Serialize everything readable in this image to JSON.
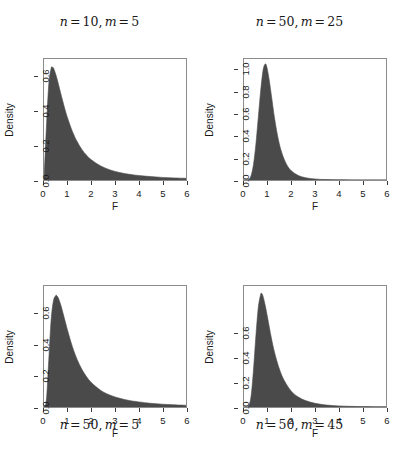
{
  "figure": {
    "background_color": "#ffffff",
    "fill_color": "#4a4a4a",
    "axis_color": "#3a3a3a",
    "box_color": "#8c8c8c"
  },
  "chart_data": [
    {
      "type": "area",
      "title": "n = 10, m = 5",
      "title_position": "top",
      "title_parts": {
        "var1": "n",
        "eq1": "=",
        "val1": "10",
        "comma": ",",
        "var2": "m",
        "eq2": "=",
        "val2": "5"
      },
      "distribution": "F",
      "df1": 10,
      "df2": 5,
      "xlabel": "F",
      "ylabel": "Density",
      "xlim": [
        0,
        6
      ],
      "ylim": [
        0,
        0.7
      ],
      "xticks": [
        "0",
        "1",
        "2",
        "3",
        "4",
        "5",
        "6"
      ],
      "xtick_values": [
        0,
        1,
        2,
        3,
        4,
        5,
        6
      ],
      "yticks": [
        "0.0",
        "0.2",
        "0.4",
        "0.6"
      ],
      "ytick_values": [
        0.0,
        0.2,
        0.4,
        0.6
      ],
      "grid": false,
      "peak_x": 0.35,
      "peak_y": 0.65,
      "x": [
        0.0,
        0.1,
        0.2,
        0.3,
        0.35,
        0.4,
        0.5,
        0.6,
        0.7,
        0.8,
        0.9,
        1.0,
        1.2,
        1.4,
        1.6,
        1.8,
        2.0,
        2.4,
        2.8,
        3.2,
        3.6,
        4.0,
        4.5,
        5.0,
        5.5,
        6.0
      ],
      "y": [
        0.0,
        0.3,
        0.55,
        0.645,
        0.652,
        0.648,
        0.61,
        0.56,
        0.505,
        0.452,
        0.402,
        0.357,
        0.281,
        0.222,
        0.177,
        0.143,
        0.117,
        0.081,
        0.058,
        0.043,
        0.033,
        0.026,
        0.02,
        0.015,
        0.012,
        0.01
      ]
    },
    {
      "type": "area",
      "title": "n = 50, m = 25",
      "title_position": "top",
      "title_parts": {
        "var1": "n",
        "eq1": "=",
        "val1": "50",
        "comma": ",",
        "var2": "m",
        "eq2": "=",
        "val2": "25"
      },
      "distribution": "F",
      "df1": 50,
      "df2": 25,
      "xlabel": "F",
      "ylabel": "Density",
      "xlim": [
        0,
        6
      ],
      "ylim": [
        0,
        1.1
      ],
      "xticks": [
        "0",
        "1",
        "2",
        "3",
        "4",
        "5",
        "6"
      ],
      "xtick_values": [
        0,
        1,
        2,
        3,
        4,
        5,
        6
      ],
      "yticks": [
        "0.0",
        "0.2",
        "0.4",
        "0.6",
        "0.8",
        "1.0"
      ],
      "ytick_values": [
        0.0,
        0.2,
        0.4,
        0.6,
        0.8,
        1.0
      ],
      "grid": false,
      "peak_x": 0.88,
      "peak_y": 1.05,
      "x": [
        0.0,
        0.2,
        0.3,
        0.4,
        0.5,
        0.6,
        0.7,
        0.8,
        0.88,
        0.95,
        1.05,
        1.15,
        1.3,
        1.45,
        1.6,
        1.8,
        2.0,
        2.3,
        2.6,
        3.0,
        3.5,
        4.0,
        4.5,
        5.0,
        5.5,
        6.0
      ],
      "y": [
        0.0,
        0.005,
        0.04,
        0.14,
        0.32,
        0.56,
        0.8,
        0.99,
        1.05,
        1.04,
        0.93,
        0.78,
        0.55,
        0.37,
        0.245,
        0.142,
        0.084,
        0.04,
        0.021,
        0.009,
        0.0035,
        0.0016,
        0.0008,
        0.0004,
        0.0002,
        0.0001
      ]
    },
    {
      "type": "area",
      "title": "n = 50, m = 5",
      "title_position": "bottom",
      "title_parts": {
        "var1": "n",
        "eq1": "=",
        "val1": "50",
        "comma": ",",
        "var2": "m",
        "eq2": "=",
        "val2": "5"
      },
      "distribution": "F",
      "df1": 50,
      "df2": 5,
      "xlabel": "F",
      "ylabel": "Density",
      "xlim": [
        0,
        6
      ],
      "ylim": [
        0,
        0.78
      ],
      "xticks": [
        "0",
        "1",
        "2",
        "3",
        "4",
        "5",
        "6"
      ],
      "xtick_values": [
        0,
        1,
        2,
        3,
        4,
        5,
        6
      ],
      "yticks": [
        "0.0",
        "0.2",
        "0.4",
        "0.6"
      ],
      "ytick_values": [
        0.0,
        0.2,
        0.4,
        0.6
      ],
      "grid": false,
      "peak_x": 0.52,
      "peak_y": 0.72,
      "x": [
        0.0,
        0.1,
        0.2,
        0.3,
        0.4,
        0.5,
        0.52,
        0.6,
        0.7,
        0.8,
        0.9,
        1.0,
        1.2,
        1.4,
        1.6,
        1.8,
        2.0,
        2.4,
        2.8,
        3.2,
        3.6,
        4.0,
        4.5,
        5.0,
        5.5,
        6.0
      ],
      "y": [
        0.0,
        0.045,
        0.3,
        0.56,
        0.685,
        0.719,
        0.72,
        0.705,
        0.662,
        0.607,
        0.549,
        0.492,
        0.389,
        0.307,
        0.243,
        0.195,
        0.158,
        0.107,
        0.076,
        0.056,
        0.042,
        0.033,
        0.024,
        0.018,
        0.014,
        0.011
      ]
    },
    {
      "type": "area",
      "title": "n = 50, m = 45",
      "title_position": "bottom",
      "title_parts": {
        "var1": "n",
        "eq1": "=",
        "val1": "50",
        "comma": ",",
        "var2": "m",
        "eq2": "=",
        "val2": "45"
      },
      "distribution": "F",
      "df1": 50,
      "df2": 45,
      "xlabel": "F",
      "ylabel": "Density",
      "xlim": [
        0,
        6
      ],
      "ylim": [
        0,
        0.98
      ],
      "xticks": [
        "0",
        "1",
        "2",
        "3",
        "4",
        "5",
        "6"
      ],
      "xtick_values": [
        0,
        1,
        2,
        3,
        4,
        5,
        6
      ],
      "yticks": [
        "0.0",
        "0.2",
        "0.4",
        "0.6"
      ],
      "ytick_values": [
        0.0,
        0.2,
        0.4,
        0.6
      ],
      "grid": false,
      "peak_x": 0.74,
      "peak_y": 0.92,
      "x": [
        0.0,
        0.1,
        0.2,
        0.3,
        0.4,
        0.5,
        0.6,
        0.7,
        0.74,
        0.8,
        0.9,
        1.0,
        1.15,
        1.3,
        1.5,
        1.7,
        2.0,
        2.3,
        2.6,
        3.0,
        3.5,
        4.0,
        4.5,
        5.0,
        5.5,
        6.0
      ],
      "y": [
        0.0,
        0.0,
        0.01,
        0.09,
        0.3,
        0.57,
        0.8,
        0.91,
        0.92,
        0.9,
        0.82,
        0.72,
        0.565,
        0.435,
        0.305,
        0.215,
        0.128,
        0.08,
        0.052,
        0.03,
        0.0155,
        0.0088,
        0.0052,
        0.0033,
        0.0022,
        0.0015
      ]
    }
  ]
}
